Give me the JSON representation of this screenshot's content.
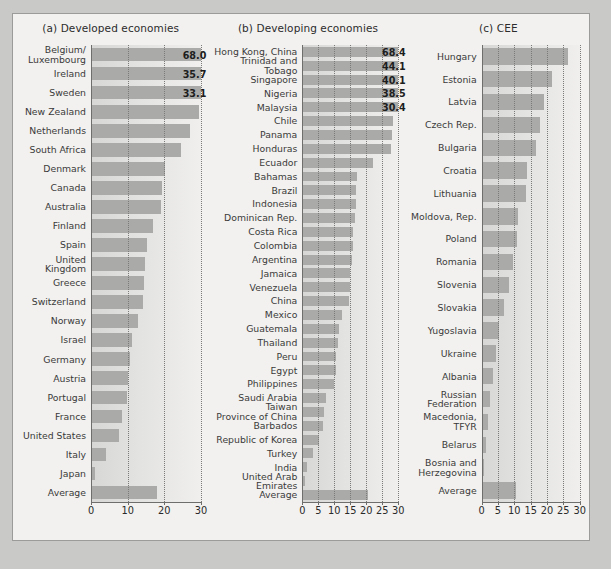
{
  "caption": "",
  "colors": {
    "page_background": "#c9c9c7",
    "figure_background": "#f2f1ef",
    "bar_fill": "#aaaaa8",
    "axis": "#6e6e6c",
    "gridline": "#7a7a78",
    "label_text": "#3a3a3a"
  },
  "chart_data": [
    {
      "type": "bar",
      "title": "(a) Developed economies",
      "orientation": "horizontal",
      "xlabel": "",
      "ylabel": "",
      "xlim": [
        0,
        30
      ],
      "ticks": [
        0,
        10,
        20,
        30
      ],
      "grid": true,
      "grid_style": "dotted",
      "note": "Top three bars exceed the axis maximum and are truncated with printed value labels.",
      "categories": [
        "Belgium/\nLuxembourg",
        "Ireland",
        "Sweden",
        "New Zealand",
        "Netherlands",
        "South Africa",
        "Denmark",
        "Canada",
        "Australia",
        "Finland",
        "Spain",
        "United\nKingdom",
        "Greece",
        "Switzerland",
        "Norway",
        "Israel",
        "Germany",
        "Austria",
        "Portugal",
        "France",
        "United States",
        "Italy",
        "Japan",
        "Average"
      ],
      "values": [
        68.0,
        35.7,
        33.1,
        29.5,
        27.0,
        24.5,
        20.3,
        19.3,
        19.2,
        17.0,
        15.2,
        14.8,
        14.5,
        14.3,
        12.9,
        11.2,
        10.5,
        10.2,
        9.8,
        8.4,
        7.6,
        4.2,
        1.2,
        18.0
      ],
      "value_labels": {
        "Belgium/\nLuxembourg": "68.0",
        "Ireland": "35.7",
        "Sweden": "33.1"
      }
    },
    {
      "type": "bar",
      "title": "(b) Developing economies",
      "orientation": "horizontal",
      "xlabel": "",
      "ylabel": "",
      "xlim": [
        0,
        30
      ],
      "ticks": [
        0,
        5,
        10,
        15,
        20,
        25,
        30
      ],
      "grid": true,
      "grid_style": "dotted",
      "note": "Top five bars exceed the axis maximum and are truncated with printed value labels.",
      "categories": [
        "Hong Kong, China",
        "Trinidad and\nTobago",
        "Singapore",
        "Nigeria",
        "Malaysia",
        "Chile",
        "Panama",
        "Honduras",
        "Ecuador",
        "Bahamas",
        "Brazil",
        "Indonesia",
        "Dominican Rep.",
        "Costa Rica",
        "Colombia",
        "Argentina",
        "Jamaica",
        "Venezuela",
        "China",
        "Mexico",
        "Guatemala",
        "Thailand",
        "Peru",
        "Egypt",
        "Philippines",
        "Saudi Arabia",
        "Taiwan\nProvince of China",
        "Barbados",
        "Republic of Korea",
        "Turkey",
        "India",
        "United Arab\nEmirates",
        "Average"
      ],
      "values": [
        68.4,
        44.1,
        40.1,
        38.5,
        30.4,
        28.3,
        28.0,
        27.6,
        22.0,
        17.0,
        16.9,
        16.8,
        16.4,
        15.9,
        15.7,
        15.6,
        15.0,
        14.8,
        14.5,
        12.5,
        11.6,
        11.2,
        10.6,
        10.4,
        9.8,
        7.3,
        6.8,
        6.5,
        5.3,
        3.4,
        1.6,
        0.7,
        20.5
      ],
      "value_labels": {
        "Hong Kong, China": "68.4",
        "Trinidad and\nTobago": "44.1",
        "Singapore": "40.1",
        "Nigeria": "38.5",
        "Malaysia": "30.4"
      }
    },
    {
      "type": "bar",
      "title": "(c) CEE",
      "orientation": "horizontal",
      "xlabel": "",
      "ylabel": "",
      "xlim": [
        0,
        30
      ],
      "ticks": [
        0,
        5,
        10,
        15,
        20,
        25,
        30
      ],
      "grid": true,
      "grid_style": "dotted",
      "categories": [
        "Hungary",
        "Estonia",
        "Latvia",
        "Czech Rep.",
        "Bulgaria",
        "Croatia",
        "Lithuania",
        "Moldova, Rep.",
        "Poland",
        "Romania",
        "Slovenia",
        "Slovakia",
        "Yugoslavia",
        "Ukraine",
        "Albania",
        "Russian\nFederation",
        "Macedonia,\nTFYR",
        "Belarus",
        "Bosnia and\nHerzegovina",
        "Average"
      ],
      "values": [
        26.5,
        21.5,
        19.0,
        18.0,
        16.5,
        14.0,
        13.5,
        11.2,
        10.8,
        9.5,
        8.5,
        6.8,
        5.2,
        4.5,
        3.4,
        2.6,
        1.9,
        1.4,
        0.7,
        10.5
      ],
      "value_labels": {}
    }
  ]
}
